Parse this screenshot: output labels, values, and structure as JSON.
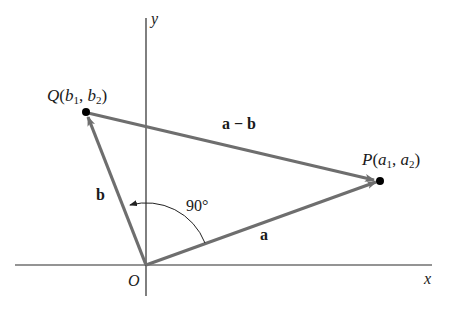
{
  "diagram": {
    "axes": {
      "x_label": "x",
      "y_label": "y",
      "origin_label": "O"
    },
    "points": {
      "P": {
        "name": "P",
        "open": "(",
        "c1": "a",
        "s1": "1",
        "sep": ", ",
        "c2": "a",
        "s2": "2",
        "close": ")"
      },
      "Q": {
        "name": "Q",
        "open": "(",
        "c1": "b",
        "s1": "1",
        "sep": ", ",
        "c2": "b",
        "s2": "2",
        "close": ")"
      }
    },
    "vectors": {
      "a": "a",
      "b": "b",
      "diff": "a − b"
    },
    "angle_label": "90°",
    "colors": {
      "vector": "#6e6e6e",
      "axis": "#2a2a2a",
      "point": "#000000"
    }
  }
}
